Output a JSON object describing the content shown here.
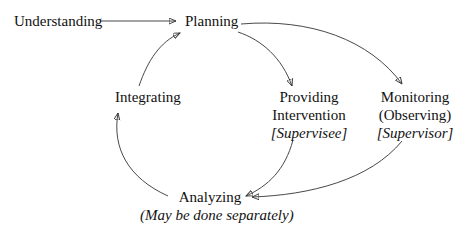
{
  "diagram": {
    "type": "cycle-flow",
    "nodes": {
      "understanding": {
        "label": "Understanding"
      },
      "planning": {
        "label": "Planning"
      },
      "integrating": {
        "label": "Integrating"
      },
      "providing": {
        "line1": "Providing",
        "line2": "Intervention",
        "role": "[Supervisee]"
      },
      "monitoring": {
        "line1": "Monitoring",
        "line2": "(Observing)",
        "role": "[Supervisor]"
      },
      "analyzing": {
        "label": "Analyzing",
        "note": "(May be done separately)"
      }
    },
    "edges": [
      {
        "from": "Understanding",
        "to": "Planning"
      },
      {
        "from": "Planning",
        "to": "Providing Intervention"
      },
      {
        "from": "Planning",
        "to": "Monitoring (Observing)"
      },
      {
        "from": "Providing Intervention",
        "to": "Analyzing"
      },
      {
        "from": "Monitoring (Observing)",
        "to": "Analyzing"
      },
      {
        "from": "Analyzing",
        "to": "Integrating"
      },
      {
        "from": "Integrating",
        "to": "Planning"
      }
    ],
    "colors": {
      "line": "#333333",
      "text": "#111111",
      "background": "#ffffff"
    }
  }
}
